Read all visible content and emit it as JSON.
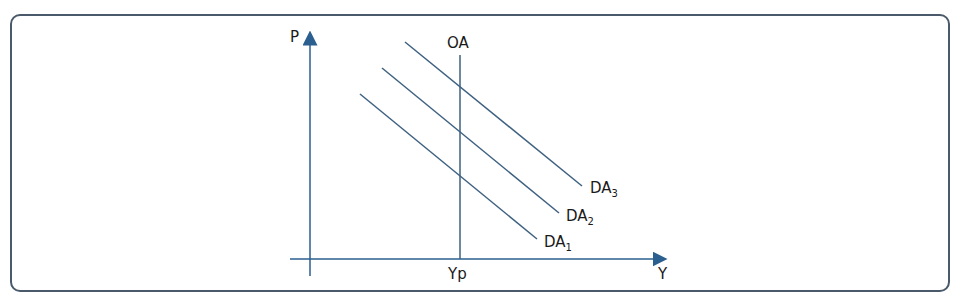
{
  "diagram": {
    "y_axis_label": "P",
    "x_axis_label": "Y",
    "vertical_line_label": "OA",
    "x_marker_label": "Yp",
    "curves": [
      {
        "base": "DA",
        "sub": "1"
      },
      {
        "base": "DA",
        "sub": "2"
      },
      {
        "base": "DA",
        "sub": "3"
      }
    ],
    "colors": {
      "axis": "#2a5f8f",
      "curve": "#3e6180",
      "frame": "#4a5a6a"
    }
  }
}
